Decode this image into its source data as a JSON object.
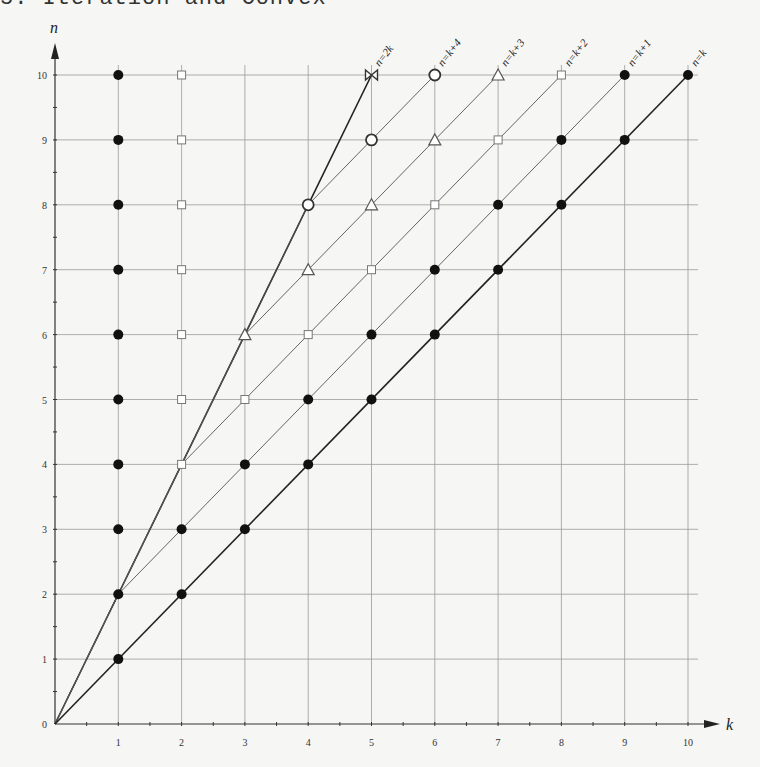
{
  "page": {
    "heading_fragment": "5. Iteration and Convex"
  },
  "chart_data": {
    "type": "scatter",
    "title": "",
    "xlabel": "k",
    "ylabel": "n",
    "xlim": [
      0,
      10
    ],
    "ylim": [
      0,
      10
    ],
    "x_ticks": [
      "1",
      "2",
      "3",
      "4",
      "5",
      "6",
      "7",
      "8",
      "9",
      "10"
    ],
    "y_ticks": [
      "0",
      "1",
      "2",
      "3",
      "4",
      "5",
      "6",
      "7",
      "8",
      "9",
      "10"
    ],
    "grid": true,
    "lines": [
      {
        "label": "n=2k",
        "from": [
          0,
          0
        ],
        "to": [
          5,
          10
        ],
        "weight": "heavy"
      },
      {
        "label": "n=k+4",
        "from": [
          0,
          0
        ],
        "to": [
          6,
          10
        ],
        "weight": "light",
        "note": "drawn from (0,0) through (4,8) then along n=k+4"
      },
      {
        "label": "n=k+3",
        "from": [
          3,
          6
        ],
        "to": [
          7,
          10
        ],
        "weight": "light"
      },
      {
        "label": "n=k+2",
        "from": [
          2,
          4
        ],
        "to": [
          8,
          10
        ],
        "weight": "light"
      },
      {
        "label": "n=k+1",
        "from": [
          1,
          2
        ],
        "to": [
          9,
          10
        ],
        "weight": "light"
      },
      {
        "label": "n=k",
        "from": [
          1,
          1
        ],
        "to": [
          10,
          10
        ],
        "weight": "heavy"
      }
    ],
    "series": [
      {
        "name": "filled-circle",
        "marker": "dot",
        "points": [
          [
            1,
            1
          ],
          [
            1,
            2
          ],
          [
            1,
            3
          ],
          [
            1,
            4
          ],
          [
            1,
            5
          ],
          [
            1,
            6
          ],
          [
            1,
            7
          ],
          [
            1,
            8
          ],
          [
            1,
            9
          ],
          [
            1,
            10
          ],
          [
            2,
            2
          ],
          [
            2,
            3
          ],
          [
            3,
            3
          ],
          [
            3,
            4
          ],
          [
            4,
            4
          ],
          [
            4,
            5
          ],
          [
            5,
            5
          ],
          [
            5,
            6
          ],
          [
            6,
            6
          ],
          [
            6,
            7
          ],
          [
            7,
            7
          ],
          [
            7,
            8
          ],
          [
            8,
            8
          ],
          [
            8,
            9
          ],
          [
            9,
            9
          ],
          [
            9,
            10
          ],
          [
            10,
            10
          ]
        ]
      },
      {
        "name": "open-square",
        "marker": "square",
        "points": [
          [
            2,
            4
          ],
          [
            2,
            5
          ],
          [
            2,
            6
          ],
          [
            2,
            7
          ],
          [
            2,
            8
          ],
          [
            2,
            9
          ],
          [
            2,
            10
          ],
          [
            3,
            5
          ],
          [
            4,
            6
          ],
          [
            5,
            7
          ],
          [
            6,
            8
          ],
          [
            7,
            9
          ],
          [
            8,
            10
          ]
        ]
      },
      {
        "name": "open-triangle",
        "marker": "triangle",
        "points": [
          [
            3,
            6
          ],
          [
            4,
            7
          ],
          [
            5,
            8
          ],
          [
            6,
            9
          ],
          [
            7,
            10
          ]
        ]
      },
      {
        "name": "open-circle",
        "marker": "circle",
        "points": [
          [
            4,
            8
          ],
          [
            5,
            9
          ],
          [
            6,
            10
          ]
        ]
      },
      {
        "name": "bowtie",
        "marker": "bowtie",
        "points": [
          [
            5,
            10
          ]
        ]
      }
    ]
  }
}
